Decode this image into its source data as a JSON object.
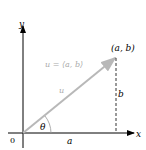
{
  "diagram": {
    "axis_x_label": "x",
    "axis_y_label": "y",
    "origin_label": "0",
    "point_label": "(a, b)",
    "vector_def_label": "u = ⟨a, b⟩",
    "vector_label": "u",
    "angle_label": "θ",
    "horizontal_label": "a",
    "vertical_label": "b",
    "colors": {
      "axes": "#000000",
      "vector": "#b8b8b8",
      "dashed": "#000000",
      "text_light": "#aaaaaa"
    }
  }
}
